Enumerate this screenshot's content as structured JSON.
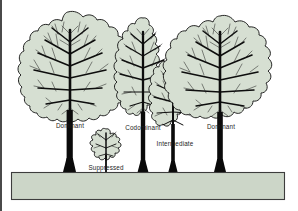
{
  "figure": {
    "background_color": "#ffffff",
    "foliage_color": "#d6dfd2",
    "outline_color": "#111111",
    "trunk_color": "#0a0a0a",
    "ground_color": "#ccd6c8",
    "ground_border_color": "#3d3d3d",
    "label_color": "#1d1d1d"
  },
  "labels": {
    "dominant_left": "Dominant",
    "suppressed": "Suppressed",
    "codominant": "Codominant",
    "intermediate": "Intermediate",
    "dominant_right": "Dominant"
  },
  "trees": [
    {
      "id": "tree-dominant-left",
      "crown_class": "Dominant",
      "label": "Dominant",
      "trunk_x": 70,
      "crown_top_y": 12,
      "crown_bottom_y": 122,
      "label_x": 70,
      "label_y": 128
    },
    {
      "id": "tree-suppressed",
      "crown_class": "Suppressed",
      "label": "Suppressed",
      "trunk_x": 106,
      "crown_top_y": 129,
      "crown_bottom_y": 164,
      "label_x": 106,
      "label_y": 170
    },
    {
      "id": "tree-codominant",
      "crown_class": "Codominant",
      "label": "Codominant",
      "trunk_x": 143,
      "crown_top_y": 18,
      "crown_bottom_y": 124,
      "label_x": 143,
      "label_y": 130
    },
    {
      "id": "tree-intermediate",
      "crown_class": "Intermediate",
      "label": "Intermediate",
      "trunk_x": 173,
      "crown_top_y": 62,
      "crown_bottom_y": 138,
      "label_x": 175,
      "label_y": 146
    },
    {
      "id": "tree-dominant-right",
      "crown_class": "Dominant",
      "label": "Dominant",
      "trunk_x": 220,
      "crown_top_y": 16,
      "crown_bottom_y": 124,
      "label_x": 221,
      "label_y": 129
    }
  ],
  "ground": {
    "name": "ground-bar",
    "x": 11,
    "y": 172,
    "width": 274,
    "height": 28
  }
}
